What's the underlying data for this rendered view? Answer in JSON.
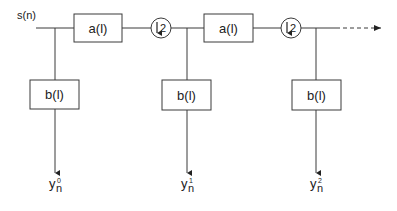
{
  "input": {
    "label": "s(n)"
  },
  "stages": [
    {
      "filter_a": "a(l)",
      "downsampler": "2",
      "filter_b": "b(l)",
      "output": {
        "base": "y",
        "sub": "n",
        "sup": "0"
      }
    },
    {
      "filter_a": "a(l)",
      "downsampler": "2",
      "filter_b": "b(l)",
      "output": {
        "base": "y",
        "sub": "n",
        "sup": "1"
      }
    },
    {
      "filter_b": "b(l)",
      "output": {
        "base": "y",
        "sub": "n",
        "sup": "2"
      }
    }
  ],
  "continuation": "dashed-arrow",
  "icons": {
    "downsample": "down-arrow-icon"
  }
}
